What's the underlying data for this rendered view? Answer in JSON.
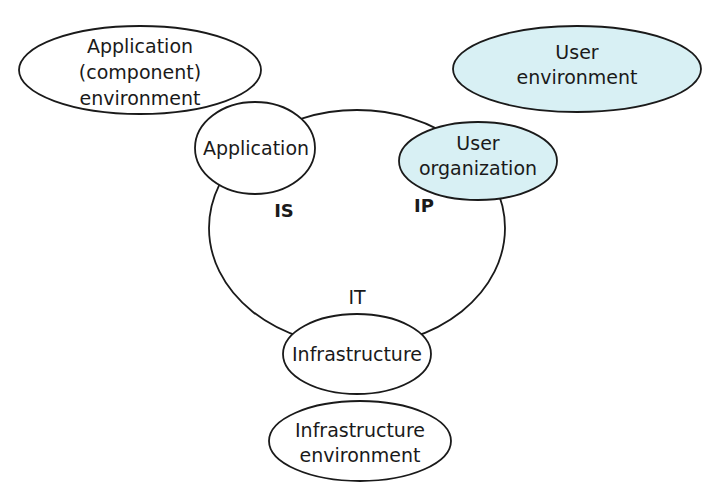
{
  "colors": {
    "stroke": "#1a1a1a",
    "user_fill": "#d8f0f4",
    "plain_fill": "#ffffff"
  },
  "diagram": {
    "core_circle": {
      "label_is": "IS",
      "label_ip": "IP",
      "label_it": "IT"
    },
    "nodes": {
      "application_env": {
        "lines": [
          "Application",
          "(component)",
          "environment"
        ]
      },
      "user_env": {
        "lines": [
          "User",
          "environment"
        ]
      },
      "application": {
        "lines": [
          "Application"
        ]
      },
      "user_org": {
        "lines": [
          "User",
          "organization"
        ]
      },
      "infrastructure": {
        "lines": [
          "Infrastructure"
        ]
      },
      "infrastructure_env": {
        "lines": [
          "Infrastructure",
          "environment"
        ]
      }
    }
  }
}
